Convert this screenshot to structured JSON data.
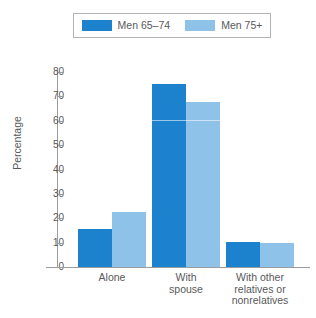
{
  "chart_data": {
    "type": "bar",
    "title": "",
    "xlabel": "",
    "ylabel": "Percentage",
    "ylim": [
      0,
      80
    ],
    "yticks": [
      "0",
      "10",
      "20",
      "30",
      "40",
      "50",
      "60",
      "70",
      "80"
    ],
    "grid": false,
    "legend_position": "top",
    "categories": [
      "Alone",
      "With\nspouse",
      "With other\nrelatives or\nnonrelatives"
    ],
    "category_lines": [
      [
        "Alone"
      ],
      [
        "With",
        "spouse"
      ],
      [
        "With other",
        "relatives or",
        "nonrelatives"
      ]
    ],
    "series": [
      {
        "name": "Men 65–74",
        "color": "#1d82cd",
        "values": [
          15.5,
          75.0,
          10.2
        ]
      },
      {
        "name": "Men 75+",
        "color": "#8fc2e8",
        "values": [
          22.7,
          67.5,
          9.8
        ]
      }
    ]
  },
  "legend": {
    "entries": [
      {
        "label": "Men 65–74",
        "color": "#1d82cd"
      },
      {
        "label": "Men 75+",
        "color": "#8fc2e8"
      }
    ]
  },
  "axes": {
    "y_title": "Percentage",
    "y_ticks": [
      "80",
      "70",
      "60",
      "50",
      "40",
      "30",
      "20",
      "10",
      "0"
    ]
  },
  "colors": {
    "series_dark": "#1d82cd",
    "series_light": "#8fc2e8",
    "axis": "#9a9c9e",
    "text": "#58595b",
    "legend_border": "#b0b2b4",
    "background": "#ffffff"
  }
}
